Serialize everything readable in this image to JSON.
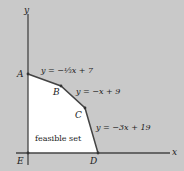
{
  "axes": {
    "x_label": "x",
    "y_label": "y"
  },
  "points": {
    "A": "A",
    "B": "B",
    "C": "C",
    "D": "D",
    "E": "E"
  },
  "lines": {
    "ab": "y = −⅓x + 7",
    "bc": "y = −x + 9",
    "cd": "y = −3x + 19"
  },
  "region_label": "feasible set",
  "colors": {
    "background": "#c9c9c9",
    "region": "#ffffff",
    "stroke": "#444444"
  }
}
